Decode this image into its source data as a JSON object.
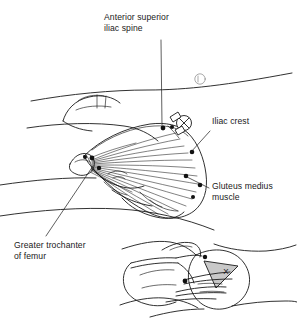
{
  "figure": {
    "background_color": "#ffffff",
    "ink_color": "#1a1a1a",
    "width": 297,
    "height": 327
  },
  "labels": {
    "anterior_superior_iliac_spine": "Anterior superior\niliac spine",
    "iliac_crest": "Iliac crest",
    "gluteus_medius_muscle": "Gluteus medius\nmuscle",
    "greater_trochanter_of_femur": "Greater trochanter\nof femur"
  },
  "markers": {
    "injection_site_x": "X",
    "site_marker_symbol": "circled-x"
  },
  "panels": {
    "main": "Lateral view of hip showing fan-shaped gluteus medius muscle and bony landmarks",
    "inset": "Hand placement on hip with shaded triangular injection target marked X"
  }
}
